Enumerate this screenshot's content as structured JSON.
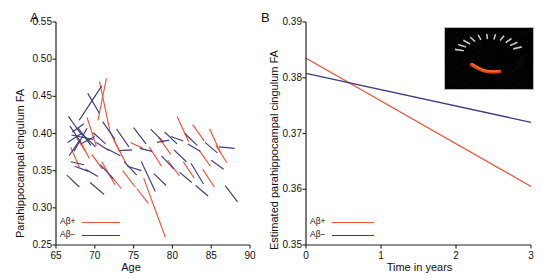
{
  "figure": {
    "panels": [
      {
        "letter": "A",
        "ylabel": "Parahippocampal cingulum FA",
        "xlabel": "Age",
        "yticks": [
          "0.55",
          "0.50",
          "0.45",
          "0.40",
          "0.35",
          "0.30",
          "0.25"
        ],
        "xticks": [
          "65",
          "70",
          "75",
          "80",
          "85",
          "90"
        ],
        "legend": [
          {
            "label": "Aβ+",
            "color": "#e8553c"
          },
          {
            "label": "Aβ−",
            "color": "#3d3c7c"
          }
        ]
      },
      {
        "letter": "B",
        "ylabel": "Estimated parahippocampal cingulum FA",
        "xlabel": "Time in years",
        "yticks": [
          "0.39",
          "0.38",
          "0.37",
          "0.36",
          "0.35"
        ],
        "xticks": [
          "0",
          "1",
          "2",
          "3"
        ],
        "legend": [
          {
            "label": "Aβ+",
            "color": "#e8553c"
          },
          {
            "label": "Aβ−",
            "color": "#3d3c7c"
          }
        ],
        "inset_alt": "sagittal-brain-mri-with-red-parahippocampal-cingulum-tract"
      }
    ]
  },
  "colors": {
    "abeta_positive": "#e8553c",
    "abeta_negative": "#3d3c7c",
    "axis": "#222222",
    "background": "#ffffff",
    "inset_background": "#000000",
    "inset_tract": "#d8411c"
  },
  "chart_data": [
    {
      "type": "line",
      "panel": "A",
      "title": "",
      "xlabel": "Age",
      "ylabel": "Parahippocampal cingulum FA",
      "xlim": [
        65,
        90
      ],
      "ylim": [
        0.25,
        0.55
      ],
      "xticks": [
        65,
        70,
        75,
        80,
        85,
        90
      ],
      "yticks": [
        0.25,
        0.3,
        0.35,
        0.4,
        0.45,
        0.5,
        0.55
      ],
      "grid": false,
      "legend_position": "bottom-left",
      "description": "Spaghetti plot: each line segment connects repeated FA measurements of one participant over age.",
      "series": [
        {
          "name": "Aβ+",
          "color": "#e8553c",
          "segments": [
            [
              [
                70.4,
                0.4175
              ],
              [
                71.5,
                0.4745
              ]
            ],
            [
              [
                70.6,
                0.47
              ],
              [
                71.9,
                0.406
              ]
            ],
            [
              [
                69.0,
                0.4215
              ],
              [
                70.2,
                0.383
              ]
            ],
            [
              [
                68.1,
                0.39
              ],
              [
                69.3,
                0.3665
              ]
            ],
            [
              [
                66.9,
                0.3815
              ],
              [
                68.0,
                0.3545
              ]
            ],
            [
              [
                71.8,
                0.406
              ],
              [
                73.2,
                0.375
              ]
            ],
            [
              [
                72.4,
                0.393
              ],
              [
                74.0,
                0.36
              ]
            ],
            [
              [
                70.9,
                0.362
              ],
              [
                72.6,
                0.331
              ]
            ],
            [
              [
                73.6,
                0.35
              ],
              [
                75.2,
                0.328
              ]
            ],
            [
              [
                74.6,
                0.388
              ],
              [
                76.2,
                0.38
              ]
            ],
            [
              [
                75.4,
                0.326
              ],
              [
                76.9,
                0.306
              ]
            ],
            [
              [
                77.0,
                0.382
              ],
              [
                78.6,
                0.356
              ]
            ],
            [
              [
                76.3,
                0.34
              ],
              [
                79.1,
                0.26
              ]
            ],
            [
              [
                78.2,
                0.395
              ],
              [
                79.8,
                0.372
              ]
            ],
            [
              [
                79.4,
                0.364
              ],
              [
                80.9,
                0.343
              ]
            ],
            [
              [
                80.6,
                0.423
              ],
              [
                82.1,
                0.389
              ]
            ],
            [
              [
                81.4,
                0.362
              ],
              [
                82.8,
                0.34
              ]
            ],
            [
              [
                82.6,
                0.412
              ],
              [
                84.1,
                0.39
              ]
            ],
            [
              [
                83.4,
                0.378
              ],
              [
                84.9,
                0.356
              ]
            ],
            [
              [
                83.9,
                0.352
              ],
              [
                85.4,
                0.328
              ]
            ],
            [
              [
                84.8,
                0.406
              ],
              [
                86.2,
                0.374
              ]
            ],
            [
              [
                85.6,
                0.384
              ],
              [
                87.0,
                0.361
              ]
            ],
            [
              [
                67.6,
                0.395
              ],
              [
                68.8,
                0.376
              ]
            ],
            [
              [
                69.6,
                0.372
              ],
              [
                71.0,
                0.352
              ]
            ],
            [
              [
                72.0,
                0.344
              ],
              [
                73.4,
                0.326
              ]
            ]
          ]
        },
        {
          "name": "Aβ−",
          "color": "#3d3c7c",
          "segments": [
            [
              [
                69.1,
                0.454
              ],
              [
                70.6,
                0.427
              ]
            ],
            [
              [
                68.0,
                0.418
              ],
              [
                70.9,
                0.464
              ]
            ],
            [
              [
                66.6,
                0.423
              ],
              [
                68.3,
                0.398
              ]
            ],
            [
              [
                66.8,
                0.41
              ],
              [
                68.2,
                0.388
              ]
            ],
            [
              [
                67.1,
                0.402
              ],
              [
                68.6,
                0.413
              ]
            ],
            [
              [
                66.5,
                0.388
              ],
              [
                68.4,
                0.401
              ]
            ],
            [
              [
                67.3,
                0.376
              ],
              [
                69.0,
                0.407
              ]
            ],
            [
              [
                66.7,
                0.37
              ],
              [
                68.1,
                0.392
              ]
            ],
            [
              [
                67.8,
                0.408
              ],
              [
                69.5,
                0.384
              ]
            ],
            [
              [
                68.5,
                0.398
              ],
              [
                70.1,
                0.382
              ]
            ],
            [
              [
                66.9,
                0.362
              ],
              [
                68.6,
                0.358
              ]
            ],
            [
              [
                67.4,
                0.356
              ],
              [
                69.2,
                0.349
              ]
            ],
            [
              [
                68.8,
                0.352
              ],
              [
                70.4,
                0.342
              ]
            ],
            [
              [
                66.4,
                0.344
              ],
              [
                68.0,
                0.328
              ]
            ],
            [
              [
                69.8,
                0.401
              ],
              [
                71.4,
                0.386
              ]
            ],
            [
              [
                70.2,
                0.388
              ],
              [
                71.8,
                0.377
              ]
            ],
            [
              [
                71.0,
                0.416
              ],
              [
                72.6,
                0.392
              ]
            ],
            [
              [
                71.6,
                0.379
              ],
              [
                73.3,
                0.37
              ]
            ],
            [
              [
                70.7,
                0.358
              ],
              [
                72.4,
                0.339
              ]
            ],
            [
              [
                72.8,
                0.406
              ],
              [
                74.4,
                0.382
              ]
            ],
            [
              [
                73.2,
                0.377
              ],
              [
                74.8,
                0.378
              ]
            ],
            [
              [
                73.8,
                0.362
              ],
              [
                75.4,
                0.344
              ]
            ],
            [
              [
                75.0,
                0.408
              ],
              [
                76.6,
                0.386
              ]
            ],
            [
              [
                75.8,
                0.38
              ],
              [
                77.4,
                0.376
              ]
            ],
            [
              [
                76.0,
                0.362
              ],
              [
                77.8,
                0.322
              ]
            ],
            [
              [
                77.2,
                0.406
              ],
              [
                78.9,
                0.388
              ]
            ],
            [
              [
                78.0,
                0.388
              ],
              [
                79.6,
                0.391
              ]
            ],
            [
              [
                78.6,
                0.37
              ],
              [
                80.2,
                0.352
              ]
            ],
            [
              [
                79.0,
                0.402
              ],
              [
                80.6,
                0.386
              ]
            ],
            [
              [
                79.8,
                0.396
              ],
              [
                81.4,
                0.39
              ]
            ],
            [
              [
                80.2,
                0.378
              ],
              [
                81.8,
                0.362
              ]
            ],
            [
              [
                80.9,
                0.348
              ],
              [
                82.5,
                0.334
              ]
            ],
            [
              [
                81.6,
                0.4
              ],
              [
                83.2,
                0.384
              ]
            ],
            [
              [
                82.0,
                0.386
              ],
              [
                83.6,
                0.376
              ]
            ],
            [
              [
                82.4,
                0.36
              ],
              [
                84.0,
                0.332
              ]
            ],
            [
              [
                83.0,
                0.33
              ],
              [
                84.6,
                0.316
              ]
            ],
            [
              [
                84.2,
                0.388
              ],
              [
                85.8,
                0.374
              ]
            ],
            [
              [
                85.0,
                0.364
              ],
              [
                86.6,
                0.352
              ]
            ],
            [
              [
                86.0,
                0.382
              ],
              [
                88.0,
                0.38
              ]
            ],
            [
              [
                86.8,
                0.33
              ],
              [
                88.4,
                0.308
              ]
            ],
            [
              [
                69.4,
                0.334
              ],
              [
                71.2,
                0.318
              ]
            ],
            [
              [
                67.0,
                0.398
              ],
              [
                69.8,
                0.392
              ]
            ],
            [
              [
                68.2,
                0.386
              ],
              [
                70.0,
                0.396
              ]
            ],
            [
              [
                74.2,
                0.356
              ],
              [
                76.0,
                0.35
              ]
            ],
            [
              [
                77.6,
                0.346
              ],
              [
                79.2,
                0.33
              ]
            ]
          ]
        }
      ]
    },
    {
      "type": "line",
      "panel": "B",
      "title": "",
      "xlabel": "Time in years",
      "ylabel": "Estimated parahippocampal cingulum FA",
      "xlim": [
        0,
        3
      ],
      "ylim": [
        0.35,
        0.39
      ],
      "xticks": [
        0,
        1,
        2,
        3
      ],
      "yticks": [
        0.35,
        0.36,
        0.37,
        0.38,
        0.39
      ],
      "grid": false,
      "legend_position": "bottom-left",
      "description": "Model-estimated linear decline of parahippocampal cingulum FA over 3 years for Aβ+ and Aβ− groups.",
      "series": [
        {
          "name": "Aβ+",
          "color": "#e8553c",
          "x": [
            0,
            3
          ],
          "values": [
            0.3835,
            0.3605
          ]
        },
        {
          "name": "Aβ−",
          "color": "#3d3c7c",
          "x": [
            0,
            3
          ],
          "values": [
            0.3808,
            0.372
          ]
        }
      ]
    }
  ]
}
